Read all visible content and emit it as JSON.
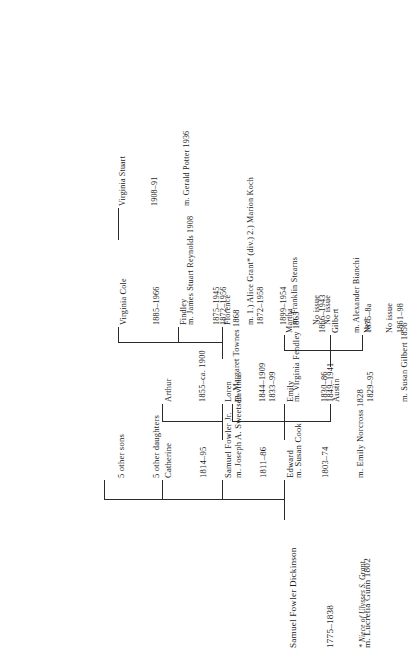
{
  "chart": {
    "type": "genealogy-tree",
    "orientation": "rotated-90-counterclockwise"
  },
  "footnote": {
    "text": "* Niece of Ulysses S. Grant"
  },
  "people": {
    "root": {
      "name": "Samuel Fowler Dickinson",
      "dates": "1775–1838",
      "marriage": "m. Lucretia Gunn 1802"
    },
    "edward": {
      "name": "Edward",
      "dates": "1803–74",
      "marriage": "m. Emily Norcross 1828"
    },
    "samuel_jr": {
      "name": "Samuel Fowler Jr.",
      "dates": "1811–86",
      "marriage": "m. Susan Cook"
    },
    "catherine": {
      "name": "Catherine",
      "dates": "1814–95",
      "marriage": "m. Joseph A. Sweetser"
    },
    "others": {
      "sons": "5 other sons",
      "daughters": "5 other daughters"
    },
    "austin": {
      "name": "Austin",
      "dates": "1829–95",
      "marriage": "m. Susan Gilbert 1856"
    },
    "emily": {
      "name": "Emily",
      "dates": "1830–86"
    },
    "lavinia": {
      "name": "Lavinia",
      "dates": "1833–99"
    },
    "ned": {
      "name": "Ned",
      "dates": "1861–98"
    },
    "gilbert": {
      "name": "Gilbert",
      "dates": "1875–8a"
    },
    "martha": {
      "name": "Martha",
      "dates": "1866–1943",
      "marriage": "m. Alexander Bianchi",
      "issue": "No issue"
    },
    "loren": {
      "name": "Loren",
      "dates": "1844–1909",
      "marriage": "m. Virginia Fendley 1865",
      "spouse_dates": "1849–1941"
    },
    "arthur": {
      "name": "Arthur",
      "dates": "1855–ca. 1900",
      "marriage": "m. Margaret Townes 1868"
    },
    "florence": {
      "name": "Florence",
      "dates": "1872–1958",
      "marriage": "m. Franklin Stearns",
      "issue": "No issue"
    },
    "findley": {
      "name": "Findley",
      "dates": "1875–1945",
      "marriage": "m. 1.) Alice Grant* (div.) 2.) Marion Koch",
      "spouse_dates": "1899–1954",
      "issue": "No issue"
    },
    "virginia_cole": {
      "name": "Virginia Cole",
      "dates": "1885–1966",
      "marriage": "m. James Stuart Reynolds 1908",
      "spouse_dates": "1872–1956"
    },
    "virginia_stuart": {
      "name": "Virginia Stuart",
      "dates": "1908–91",
      "marriage": "m. Gerald Potter 1936"
    }
  }
}
